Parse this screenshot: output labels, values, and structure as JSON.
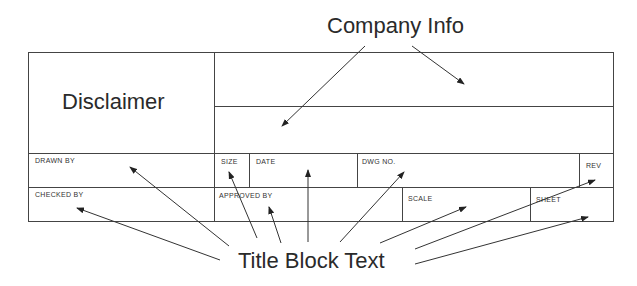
{
  "callouts": {
    "company_info": "Company Info",
    "title_block_text": "Title Block Text"
  },
  "title_block": {
    "disclaimer": "Disclaimer",
    "row1": {
      "drawn_by": "DRAWN BY",
      "size": "SIZE",
      "date": "DATE",
      "dwg_no": "DWG NO.",
      "rev": "REV"
    },
    "row2": {
      "checked_by": "CHECKED BY",
      "approved_by": "APPROVED BY",
      "scale": "SCALE",
      "sheet": "SHEET"
    }
  }
}
